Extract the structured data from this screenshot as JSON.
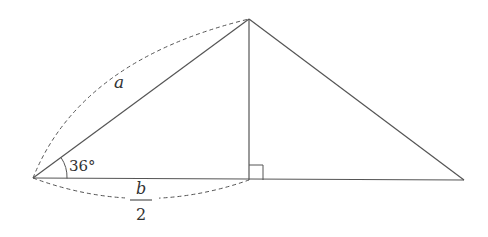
{
  "diagram": {
    "type": "triangle-with-altitude",
    "colors": {
      "line": "#555555",
      "text": "#333333",
      "background": "#ffffff"
    },
    "vertices": {
      "left": [
        33,
        178
      ],
      "top": [
        249,
        19
      ],
      "foot": [
        249,
        180
      ],
      "right": [
        464,
        180
      ]
    },
    "labels": {
      "hypotenuse": "a",
      "angle": "36°",
      "base_numerator": "b",
      "base_denominator": "2"
    },
    "marks": {
      "right_angle_at": "foot",
      "dashed_arc_over": "left-top segment",
      "dashed_arc_under": "left-foot segment"
    }
  }
}
